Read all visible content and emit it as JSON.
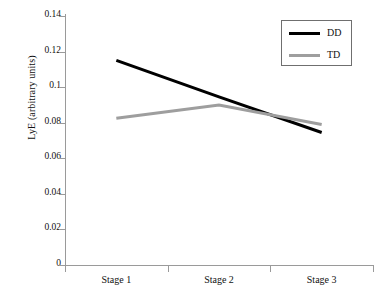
{
  "chart_data": {
    "type": "line",
    "title": "",
    "xlabel": "",
    "ylabel": "LyE (arbitrary units)",
    "categories": [
      "Stage 1",
      "Stage 2",
      "Stage 3"
    ],
    "ylim": [
      0,
      0.14
    ],
    "yticks": [
      "0",
      "0.02",
      "0.04",
      "0.06",
      "0.08",
      "0.1",
      "0.12",
      "0.14"
    ],
    "ytick_values": [
      0,
      0.02,
      0.04,
      0.06,
      0.08,
      0.1,
      0.12,
      0.14
    ],
    "grid": false,
    "legend_position": "top-right",
    "series": [
      {
        "name": "DD",
        "color": "#000000",
        "width": 3,
        "values": [
          0.115,
          0.0945,
          0.0745
        ]
      },
      {
        "name": "TD",
        "color": "#9e9e9e",
        "width": 3,
        "values": [
          0.0825,
          0.09,
          0.079
        ]
      }
    ]
  },
  "axis": {
    "y_label": "LyE (arbitrary units)",
    "y_tick_labels": [
      "0.14",
      "0.12",
      "0.1",
      "0.08",
      "0.06",
      "0.04",
      "0.02",
      "0"
    ],
    "x_tick_labels": [
      "Stage 1",
      "Stage 2",
      "Stage 3"
    ]
  },
  "legend": {
    "entries": [
      {
        "label": "DD",
        "color": "#000000"
      },
      {
        "label": "TD",
        "color": "#9e9e9e"
      }
    ]
  }
}
